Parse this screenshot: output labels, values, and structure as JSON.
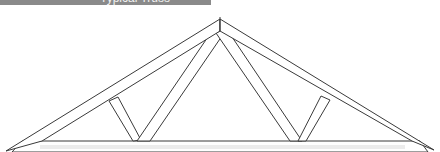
{
  "banner": {
    "text": "Typical Truss",
    "color": "#8a8a8a"
  },
  "diagram": {
    "colors": {
      "line": "#3a3a3a",
      "fill": "#ffffff",
      "shade": "#ececec"
    },
    "apex": [
      220,
      20
    ],
    "span": [
      0,
      440
    ],
    "members": [
      {
        "name": "left-top-chord"
      },
      {
        "name": "right-top-chord"
      },
      {
        "name": "bottom-chord"
      },
      {
        "name": "left-outer-web"
      },
      {
        "name": "left-inner-web"
      },
      {
        "name": "right-inner-web"
      },
      {
        "name": "right-outer-web"
      }
    ]
  }
}
